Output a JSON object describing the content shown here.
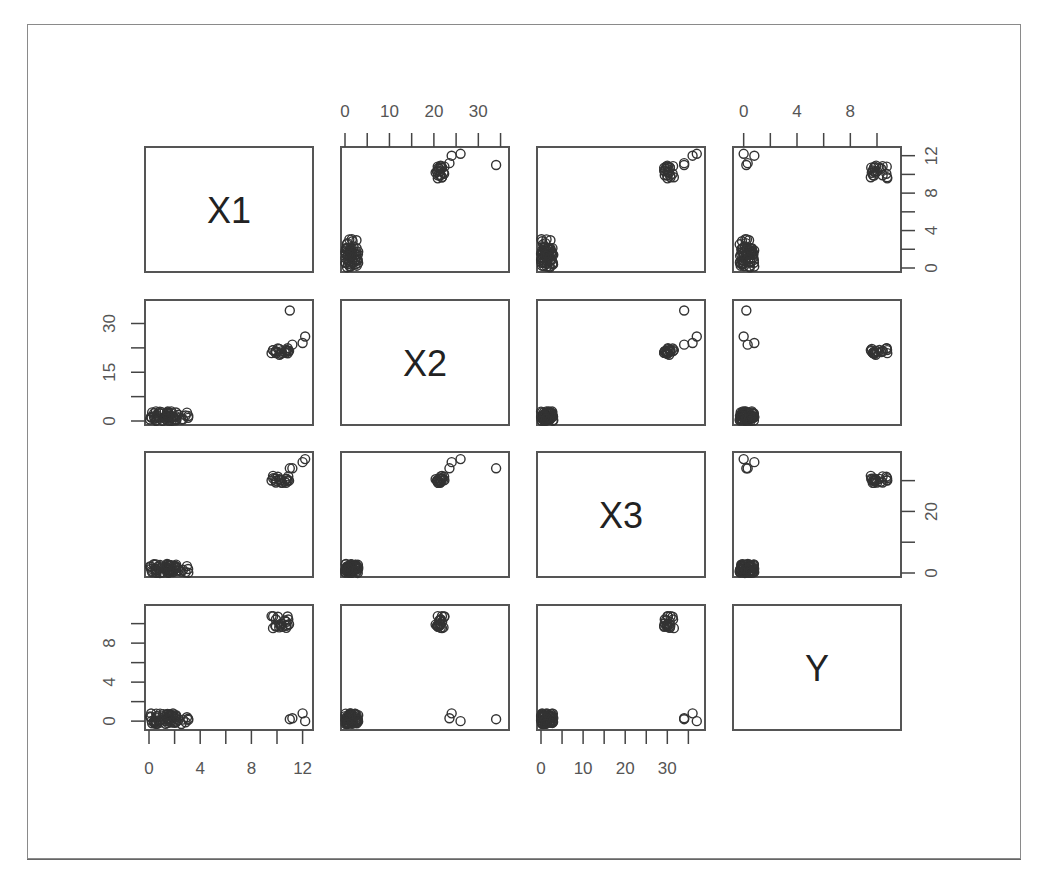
{
  "chart_data": {
    "type": "scatter-matrix",
    "title": "",
    "variables": [
      "X1",
      "X2",
      "X3",
      "Y"
    ],
    "axes": {
      "X1": {
        "ticks": [
          0,
          4,
          8,
          12
        ],
        "range": [
          0,
          12.5
        ]
      },
      "X2": {
        "ticks": [
          0,
          10,
          20,
          30
        ],
        "range": [
          0,
          36
        ],
        "alt_ticks": [
          0,
          15,
          30
        ]
      },
      "X3": {
        "ticks": [
          0,
          10,
          20,
          30
        ],
        "range": [
          0,
          38
        ],
        "alt_ticks": [
          0,
          20
        ]
      },
      "Y": {
        "ticks": [
          0,
          4,
          8
        ],
        "range": [
          -0.5,
          11.5
        ],
        "alt_ticks": [
          0,
          4,
          8,
          12
        ]
      }
    },
    "axis_labels": {
      "top": [
        {
          "panel_col": 1,
          "labels": [
            "0",
            "10",
            "20",
            "30"
          ]
        },
        {
          "panel_col": 3,
          "labels": [
            "0",
            "4",
            "8"
          ]
        }
      ],
      "right": [
        {
          "panel_row": 0,
          "labels": [
            "0",
            "4",
            "8",
            "12"
          ]
        },
        {
          "panel_row": 2,
          "labels": [
            "0",
            "20"
          ]
        }
      ],
      "left": [
        {
          "panel_row": 1,
          "labels": [
            "0",
            "15",
            "30"
          ]
        },
        {
          "panel_row": 3,
          "labels": [
            "0",
            "4",
            "8"
          ]
        }
      ],
      "bottom": [
        {
          "panel_col": 0,
          "labels": [
            "0",
            "4",
            "8",
            "12"
          ]
        },
        {
          "panel_col": 2,
          "labels": [
            "0",
            "10",
            "20",
            "30"
          ]
        }
      ]
    },
    "clusters": [
      {
        "name": "low cluster",
        "X1": [
          0,
          3.2
        ],
        "X2": [
          0,
          3
        ],
        "X3": [
          0,
          3
        ],
        "Y": [
          -0.3,
          0.8
        ],
        "n": 60
      },
      {
        "name": "high cluster",
        "X1": [
          9.5,
          11
        ],
        "X2": [
          20,
          22.5
        ],
        "X3": [
          29,
          32
        ],
        "Y": [
          9.5,
          10.8
        ],
        "n": 20
      }
    ],
    "outliers": [
      {
        "X1": 11,
        "X2": 34,
        "X3": 34,
        "Y": 0.2
      },
      {
        "X1": 12,
        "X2": 24,
        "X3": 36,
        "Y": 0.8
      },
      {
        "X1": 12.2,
        "X2": 26,
        "X3": 37,
        "Y": 0.0
      },
      {
        "X1": 11.2,
        "X2": 23.5,
        "X3": 34,
        "Y": 0.3
      }
    ],
    "grid": false,
    "legend": null,
    "marker": "open-circle"
  },
  "colors": {
    "ink": "#333333",
    "frame": "#8a8a8a",
    "background": "#ffffff"
  }
}
